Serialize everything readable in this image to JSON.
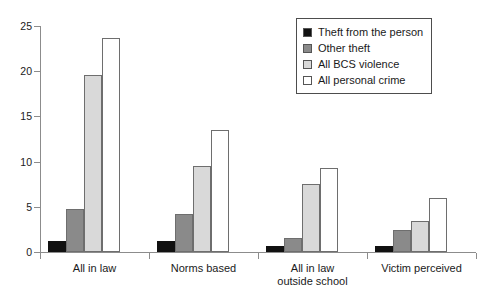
{
  "chart_data": {
    "type": "bar",
    "title": "",
    "subtitle": "",
    "xlabel": "",
    "ylabel": "",
    "ylim": [
      0,
      25
    ],
    "yticks": [
      0,
      5,
      10,
      15,
      20,
      25
    ],
    "ytick_labels": [
      "0",
      "5",
      "10",
      "15",
      "20",
      "25"
    ],
    "grid": false,
    "legend_position": "top-right",
    "categories": [
      "All in law",
      "Norms based",
      "All in law outside school",
      "Victim perceived"
    ],
    "category_lines": [
      [
        "All in law"
      ],
      [
        "Norms based"
      ],
      [
        "All in law",
        "outside school"
      ],
      [
        "Victim perceived"
      ]
    ],
    "series": [
      {
        "name": "Theft from the person",
        "color": "#111111",
        "values": [
          1.2,
          1.2,
          0.7,
          0.7
        ]
      },
      {
        "name": "Other theft",
        "color": "#8a8a8a",
        "values": [
          4.8,
          4.2,
          1.5,
          2.4
        ]
      },
      {
        "name": "All BCS violence",
        "color": "#d9d9d9",
        "values": [
          19.6,
          9.5,
          7.5,
          3.4
        ]
      },
      {
        "name": "All personal crime",
        "color": "#ffffff",
        "values": [
          23.7,
          13.5,
          9.3,
          6.0
        ]
      }
    ]
  },
  "legend": {
    "items": [
      {
        "label": "Theft from the person",
        "color": "#111111"
      },
      {
        "label": "Other theft",
        "color": "#8a8a8a"
      },
      {
        "label": "All BCS violence",
        "color": "#d9d9d9"
      },
      {
        "label": "All personal crime",
        "color": "#ffffff"
      }
    ]
  },
  "axis": {
    "y_tick_labels": [
      "0",
      "5",
      "10",
      "15",
      "20",
      "25"
    ]
  }
}
